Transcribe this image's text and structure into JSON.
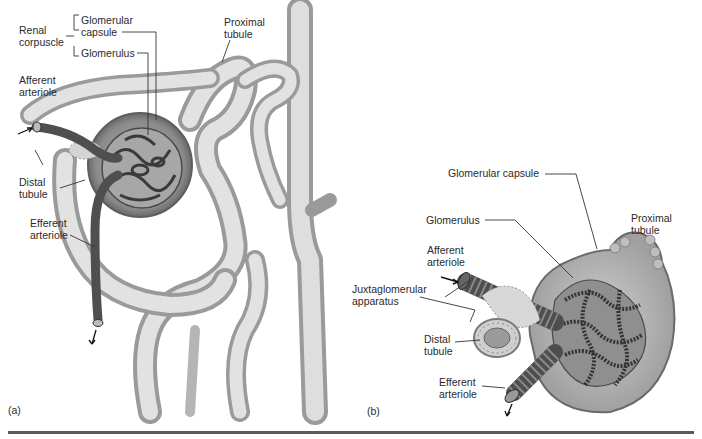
{
  "panel_a": {
    "panel_label": "(a)",
    "labels": {
      "renal_corpuscle": "Renal\ncorpuscle",
      "glomerular_capsule": "Glomerular\ncapsule",
      "glomerulus": "Glomerulus",
      "proximal_tubule": "Proximal\ntubule",
      "afferent_arteriole": "Afferent\narteriole",
      "distal_tubule": "Distal\ntubule",
      "efferent_arteriole": "Efferent\narteriole"
    }
  },
  "panel_b": {
    "panel_label": "(b)",
    "labels": {
      "glomerular_capsule": "Glomerular capsule",
      "glomerulus": "Glomerulus",
      "proximal_tubule": "Proximal\ntubule",
      "afferent_arteriole": "Afferent\narteriole",
      "juxtaglomerular_apparatus": "Juxtaglomerular\napparatus",
      "distal_tubule": "Distal\ntubule",
      "efferent_arteriole": "Efferent\narteriole"
    }
  },
  "colors": {
    "tubule": "#c9c9c9",
    "vessel": "#555555",
    "capsule": "#8a8a8a",
    "rule": "#5a5a5a"
  }
}
